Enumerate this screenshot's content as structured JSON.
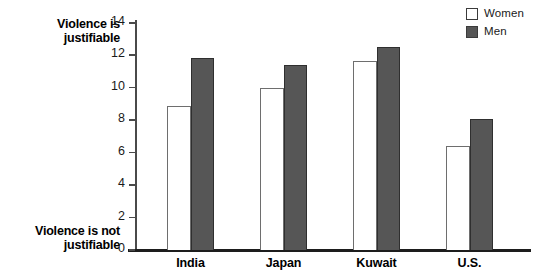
{
  "chart_data": {
    "type": "bar",
    "title": "",
    "subtitle": "",
    "xlabel": "",
    "ylabel": "",
    "ylim": [
      0,
      14
    ],
    "yticks": [
      0,
      2,
      4,
      6,
      8,
      10,
      12,
      14
    ],
    "grid": false,
    "legend_position": "top-right",
    "axis_endpoint_labels": {
      "top": "Violence is justifiable",
      "bottom": "Violence is not justifiable"
    },
    "categories": [
      "India",
      "Japan",
      "Kuwait",
      "U.S."
    ],
    "series": [
      {
        "name": "Women",
        "color": "#ffffff",
        "edge_color": "#6e6e6e",
        "values": [
          8.9,
          10.0,
          11.65,
          6.4
        ]
      },
      {
        "name": "Men",
        "color": "#565656",
        "edge_color": "#2f2f2f",
        "values": [
          11.85,
          11.4,
          12.5,
          8.1
        ]
      }
    ]
  },
  "legend": {
    "items": [
      {
        "label": "Women",
        "swatch": "open-square-swatch"
      },
      {
        "label": "Men",
        "swatch": "filled-square-swatch"
      }
    ]
  },
  "axis_labels": {
    "top": "Violence is justifiable",
    "bottom": "Violence is not justifiable"
  },
  "colors": {
    "men_bar": "#565656",
    "women_bar": "#ffffff",
    "axis": "#1d1d1d"
  }
}
